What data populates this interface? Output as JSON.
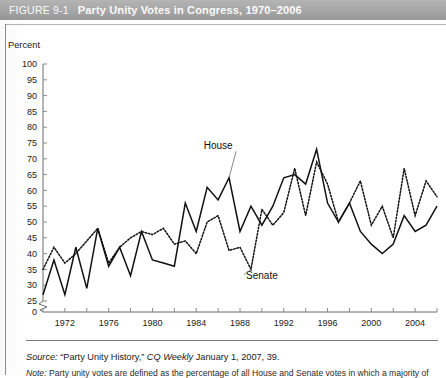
{
  "figure": {
    "number": "FIGURE 9-1",
    "title": "Party Unity Votes in Congress, 1970–2006",
    "header_bg": "#a8a8a8",
    "header_text_color": "#ffffff"
  },
  "source": {
    "label": "Source:",
    "text": "“Party Unity History,” CQ Weekly, January 1, 2007, 39.",
    "publication": "CQ Weekly",
    "quoted_title": "“Party Unity History,”",
    "rest": " January 1, 2007, 39."
  },
  "note": {
    "label": "Note:",
    "text": "Party unity votes are defined as the percentage of all House and Senate votes in which a majority of"
  },
  "labels": {
    "house": "House",
    "senate": "Senate"
  },
  "chart_data": {
    "type": "line",
    "title": "Party Unity Votes in Congress, 1970–2006",
    "xlabel": "",
    "ylabel": "Percent",
    "ylim": [
      25,
      100
    ],
    "y_axis_break_below": 25,
    "y_zero_shown": true,
    "yticks": [
      0,
      25,
      30,
      35,
      40,
      45,
      50,
      55,
      60,
      65,
      70,
      75,
      80,
      85,
      90,
      95,
      100
    ],
    "ytick_labels": [
      "0",
      "25",
      "30",
      "35",
      "40",
      "45",
      "50",
      "55",
      "60",
      "65",
      "70",
      "75",
      "80",
      "85",
      "90",
      "95",
      "100"
    ],
    "xlim": [
      1970,
      2006
    ],
    "xticks_minor_every": 2,
    "xtick_labels": [
      "1972",
      "1976",
      "1980",
      "1984",
      "1988",
      "1992",
      "1996",
      "2000",
      "2004"
    ],
    "xtick_label_years": [
      1972,
      1976,
      1980,
      1984,
      1988,
      1992,
      1996,
      2000,
      2004
    ],
    "grid": false,
    "legend_position": "inline-annotation",
    "x": [
      1970,
      1971,
      1972,
      1973,
      1974,
      1975,
      1976,
      1977,
      1978,
      1979,
      1980,
      1981,
      1982,
      1983,
      1984,
      1985,
      1986,
      1987,
      1988,
      1989,
      1990,
      1991,
      1992,
      1993,
      1994,
      1995,
      1996,
      1997,
      1998,
      1999,
      2000,
      2001,
      2002,
      2003,
      2004,
      2005,
      2006
    ],
    "series": [
      {
        "name": "House",
        "style": "solid",
        "color": "#111111",
        "values": [
          27,
          38,
          27,
          42,
          29,
          48,
          36,
          42,
          33,
          47,
          38,
          37,
          36,
          56,
          47,
          61,
          57,
          64,
          47,
          55,
          49,
          55,
          64,
          65,
          62,
          73,
          56,
          50,
          56,
          47,
          43,
          40,
          43,
          52,
          47,
          49,
          55
        ]
      },
      {
        "name": "Senate",
        "style": "dotted",
        "color": "#111111",
        "values": [
          35,
          42,
          37,
          40,
          44,
          48,
          37,
          42,
          45,
          47,
          46,
          48,
          43,
          44,
          40,
          50,
          52,
          41,
          42,
          35,
          54,
          49,
          53,
          67,
          52,
          69,
          62,
          50,
          56,
          63,
          49,
          55,
          45,
          67,
          52,
          63,
          58
        ]
      }
    ],
    "annotations": [
      {
        "text": "House",
        "x": 1986,
        "y": 73,
        "points_to_year": 1987
      },
      {
        "text": "Senate",
        "x": 1990,
        "y": 32,
        "points_to_year": 1989
      }
    ]
  }
}
